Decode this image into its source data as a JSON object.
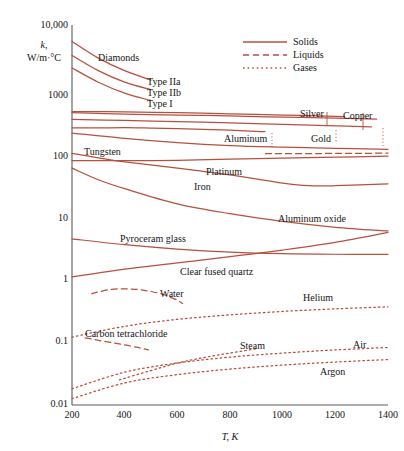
{
  "chart_data": {
    "type": "line",
    "title": "",
    "xlabel": "T, K",
    "ylabel": "k, W/m·°C",
    "ylabel_symbol": "k,",
    "ylabel_units": "W/m·°C",
    "xlim": [
      200,
      1400
    ],
    "ylim": [
      0.01,
      10000
    ],
    "yscale": "log",
    "xscale": "linear",
    "grid": false,
    "xticks": [
      200,
      400,
      600,
      800,
      1000,
      1200,
      1400
    ],
    "xtick_labels": [
      "200",
      "400",
      "600",
      "800",
      "1000",
      "1200",
      "1400"
    ],
    "yticks": [
      0.01,
      0.1,
      1,
      10,
      100,
      1000,
      10000
    ],
    "ytick_labels": [
      "0.01",
      "0.1",
      "1",
      "10",
      "100",
      "1000",
      "10,000"
    ],
    "line_color": "#b5503f",
    "axis_color": "#5a5a5a",
    "legend": {
      "position": "top-right",
      "entries": [
        {
          "label": "Solids",
          "style": "solid"
        },
        {
          "label": "Liquids",
          "style": "dashed"
        },
        {
          "label": "Gases",
          "style": "dotted"
        }
      ]
    },
    "group_label": "Diamonds",
    "series": [
      {
        "name": "Type IIa",
        "style": "solid",
        "label": "Type IIa",
        "points": [
          [
            200,
            5500
          ],
          [
            300,
            3000
          ],
          [
            400,
            1900
          ],
          [
            500,
            1350
          ]
        ]
      },
      {
        "name": "Type IIb",
        "style": "solid",
        "label": "Type IIb",
        "points": [
          [
            200,
            3300
          ],
          [
            300,
            1900
          ],
          [
            400,
            1250
          ],
          [
            500,
            950
          ]
        ]
      },
      {
        "name": "Type I",
        "style": "solid",
        "label": "Type I",
        "points": [
          [
            200,
            2100
          ],
          [
            300,
            1250
          ],
          [
            400,
            840
          ],
          [
            500,
            640
          ]
        ]
      },
      {
        "name": "Silver",
        "style": "solid",
        "label": "Silver",
        "points": [
          [
            200,
            430
          ],
          [
            400,
            425
          ],
          [
            600,
            412
          ],
          [
            800,
            396
          ],
          [
            1000,
            379
          ],
          [
            1200,
            361
          ],
          [
            1235,
            358
          ]
        ]
      },
      {
        "name": "Copper",
        "style": "solid",
        "label": "Copper",
        "points": [
          [
            200,
            413
          ],
          [
            400,
            393
          ],
          [
            600,
            379
          ],
          [
            800,
            366
          ],
          [
            1000,
            352
          ],
          [
            1200,
            339
          ],
          [
            1357,
            327
          ]
        ]
      },
      {
        "name": "Gold",
        "style": "solid",
        "label": "Gold",
        "points": [
          [
            200,
            323
          ],
          [
            400,
            311
          ],
          [
            600,
            298
          ],
          [
            800,
            284
          ],
          [
            1000,
            270
          ],
          [
            1200,
            255
          ],
          [
            1337,
            247
          ]
        ]
      },
      {
        "name": "Aluminum",
        "style": "solid",
        "label": "Aluminum",
        "points": [
          [
            200,
            237
          ],
          [
            300,
            237
          ],
          [
            400,
            240
          ],
          [
            500,
            236
          ],
          [
            600,
            231
          ],
          [
            700,
            225
          ],
          [
            800,
            218
          ],
          [
            900,
            210
          ],
          [
            933,
            207
          ]
        ]
      },
      {
        "name": "Liquid metal",
        "style": "dashed",
        "label": "",
        "points": [
          [
            935,
            93
          ],
          [
            1000,
            93
          ],
          [
            1100,
            93
          ],
          [
            1200,
            94
          ],
          [
            1300,
            94
          ],
          [
            1400,
            95
          ]
        ]
      },
      {
        "name": "Tungsten",
        "style": "solid",
        "label": "Tungsten",
        "points": [
          [
            200,
            197
          ],
          [
            400,
            162
          ],
          [
            600,
            139
          ],
          [
            800,
            125
          ],
          [
            1000,
            118
          ],
          [
            1200,
            113
          ],
          [
            1400,
            109
          ]
        ]
      },
      {
        "name": "Platinum",
        "style": "solid",
        "label": "Platinum",
        "points": [
          [
            200,
            72
          ],
          [
            400,
            72
          ],
          [
            600,
            73
          ],
          [
            800,
            76
          ],
          [
            1000,
            79
          ],
          [
            1200,
            82
          ],
          [
            1400,
            85
          ]
        ]
      },
      {
        "name": "Iron",
        "style": "solid",
        "label": "Iron",
        "points": [
          [
            200,
            94
          ],
          [
            300,
            80
          ],
          [
            400,
            69
          ],
          [
            600,
            55
          ],
          [
            800,
            43
          ],
          [
            1000,
            32
          ],
          [
            1100,
            29
          ],
          [
            1200,
            29
          ],
          [
            1400,
            31
          ]
        ]
      },
      {
        "name": "Aluminum oxide",
        "style": "solid",
        "label": "Aluminum oxide",
        "points": [
          [
            200,
            55
          ],
          [
            300,
            36
          ],
          [
            400,
            26
          ],
          [
            600,
            15
          ],
          [
            800,
            10.5
          ],
          [
            1000,
            7.9
          ],
          [
            1200,
            6.4
          ],
          [
            1400,
            5.6
          ]
        ]
      },
      {
        "name": "Pyroceram glass",
        "style": "solid",
        "label": "Pyroceram glass",
        "points": [
          [
            200,
            4.2
          ],
          [
            400,
            3.4
          ],
          [
            600,
            2.9
          ],
          [
            800,
            2.6
          ],
          [
            1000,
            2.45
          ],
          [
            1200,
            2.4
          ],
          [
            1400,
            2.4
          ]
        ]
      },
      {
        "name": "Clear fused quartz",
        "style": "solid",
        "label": "Clear fused quartz",
        "points": [
          [
            200,
            1.05
          ],
          [
            400,
            1.4
          ],
          [
            600,
            1.75
          ],
          [
            800,
            2.2
          ],
          [
            1000,
            2.8
          ],
          [
            1200,
            3.7
          ],
          [
            1400,
            5.3
          ]
        ]
      },
      {
        "name": "Water",
        "style": "dashed",
        "label": "Water",
        "points": [
          [
            275,
            0.57
          ],
          [
            300,
            0.61
          ],
          [
            350,
            0.67
          ],
          [
            400,
            0.68
          ],
          [
            450,
            0.665
          ],
          [
            500,
            0.62
          ],
          [
            550,
            0.55
          ],
          [
            600,
            0.45
          ],
          [
            620,
            0.4
          ]
        ]
      },
      {
        "name": "Carbon tetrachloride",
        "style": "dashed",
        "label": "Carbon tetrachloride",
        "points": [
          [
            250,
            0.115
          ],
          [
            300,
            0.105
          ],
          [
            350,
            0.097
          ],
          [
            400,
            0.089
          ],
          [
            450,
            0.081
          ],
          [
            490,
            0.074
          ]
        ]
      },
      {
        "name": "Helium",
        "style": "dotted",
        "label": "Helium",
        "points": [
          [
            200,
            0.118
          ],
          [
            400,
            0.175
          ],
          [
            600,
            0.225
          ],
          [
            800,
            0.265
          ],
          [
            1000,
            0.3
          ],
          [
            1200,
            0.33
          ],
          [
            1400,
            0.355
          ]
        ]
      },
      {
        "name": "Steam",
        "style": "dotted",
        "label": "Steam",
        "points": [
          [
            380,
            0.025
          ],
          [
            500,
            0.035
          ],
          [
            600,
            0.046
          ],
          [
            700,
            0.056
          ],
          [
            800,
            0.066
          ],
          [
            900,
            0.077
          ]
        ]
      },
      {
        "name": "Air",
        "style": "dotted",
        "label": "Air",
        "points": [
          [
            200,
            0.018
          ],
          [
            400,
            0.033
          ],
          [
            600,
            0.046
          ],
          [
            800,
            0.057
          ],
          [
            1000,
            0.066
          ],
          [
            1200,
            0.074
          ],
          [
            1400,
            0.081
          ]
        ]
      },
      {
        "name": "Argon",
        "style": "dotted",
        "label": "Argon",
        "points": [
          [
            200,
            0.0126
          ],
          [
            400,
            0.0223
          ],
          [
            600,
            0.0302
          ],
          [
            800,
            0.0369
          ],
          [
            1000,
            0.0427
          ],
          [
            1200,
            0.0477
          ],
          [
            1400,
            0.0522
          ]
        ]
      }
    ],
    "annotations": [
      {
        "text": "Diamonds",
        "x": 98,
        "y": 61,
        "anchor": "start"
      },
      {
        "text": "Type IIa",
        "x": 147,
        "y": 85,
        "anchor": "start"
      },
      {
        "text": "Type IIb",
        "x": 147,
        "y": 96,
        "anchor": "start"
      },
      {
        "text": "Type I",
        "x": 147,
        "y": 107,
        "anchor": "start"
      },
      {
        "text": "Silver",
        "x": 300,
        "y": 117,
        "anchor": "start"
      },
      {
        "text": "Copper",
        "x": 343,
        "y": 119,
        "anchor": "start"
      },
      {
        "text": "Gold",
        "x": 311,
        "y": 142,
        "anchor": "start"
      },
      {
        "text": "Aluminum",
        "x": 224,
        "y": 142,
        "anchor": "start"
      },
      {
        "text": "Tungsten",
        "x": 84,
        "y": 155,
        "anchor": "start"
      },
      {
        "text": "Platinum",
        "x": 206,
        "y": 175,
        "anchor": "start"
      },
      {
        "text": "Iron",
        "x": 194,
        "y": 190,
        "anchor": "start"
      },
      {
        "text": "Aluminum oxide",
        "x": 278,
        "y": 222,
        "anchor": "start"
      },
      {
        "text": "Pyroceram glass",
        "x": 120,
        "y": 242,
        "anchor": "start"
      },
      {
        "text": "Clear fused quartz",
        "x": 180,
        "y": 275,
        "anchor": "start"
      },
      {
        "text": "Water",
        "x": 160,
        "y": 297,
        "anchor": "start"
      },
      {
        "text": "Carbon tetrachloride",
        "x": 85,
        "y": 337,
        "anchor": "start"
      },
      {
        "text": "Helium",
        "x": 303,
        "y": 301,
        "anchor": "start"
      },
      {
        "text": "Steam",
        "x": 240,
        "y": 349,
        "anchor": "start"
      },
      {
        "text": "Air",
        "x": 353,
        "y": 348,
        "anchor": "start"
      },
      {
        "text": "Argon",
        "x": 320,
        "y": 375,
        "anchor": "start"
      }
    ]
  }
}
